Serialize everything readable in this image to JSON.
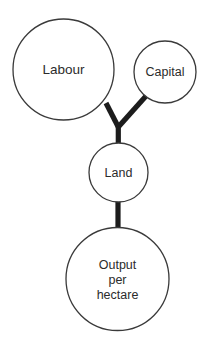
{
  "diagram": {
    "background_color": "#ffffff",
    "node_stroke_color": "#3a3a3a",
    "node_fill_color": "#ffffff",
    "connector_color": "#1c1c1c",
    "label_color": "#2b2b2b",
    "nodes": [
      {
        "id": "labour",
        "label": "Labour",
        "shape": "circle",
        "cx": 63.5,
        "cy": 69.5,
        "r": 50.5
      },
      {
        "id": "capital",
        "label": "Capital",
        "shape": "circle",
        "cx": 165,
        "cy": 72,
        "r": 31
      },
      {
        "id": "land",
        "label": "Land",
        "shape": "circle",
        "cx": 118.5,
        "cy": 172.5,
        "r": 29.5
      },
      {
        "id": "output",
        "label": "Output per hectare",
        "label_lines": [
          "Output",
          "per",
          "hectare"
        ],
        "shape": "circle",
        "cx": 117.5,
        "cy": 279,
        "r": 51.5
      }
    ],
    "connectors": [
      {
        "id": "labour-to-land",
        "from": "labour",
        "to": "land",
        "style": "thick-line"
      },
      {
        "id": "capital-to-land",
        "from": "capital",
        "to": "land",
        "style": "thick-line"
      },
      {
        "id": "junction-to-land",
        "from": "junction",
        "to": "land",
        "style": "thick-line"
      },
      {
        "id": "land-to-output",
        "from": "land",
        "to": "output",
        "style": "thick-line"
      }
    ]
  }
}
